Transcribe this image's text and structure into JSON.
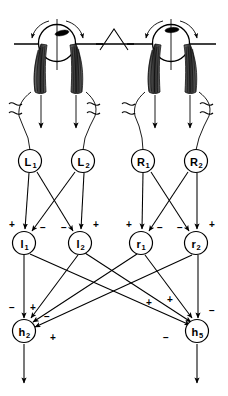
{
  "figure": {
    "title": "",
    "type": "neural-network-schematic",
    "background_color": "#ffffff",
    "ink_color": "#000000"
  },
  "anatomy": {
    "description": "Two eyeballs seen from above with horizontal reference line and central nose triangle",
    "left_eye": {
      "name": "left-eye",
      "pupil": "pupil-marker",
      "rotation_arrows": 2,
      "muscles": 2
    },
    "right_eye": {
      "name": "right-eye",
      "pupil": "pupil-marker",
      "rotation_arrows": 2,
      "muscles": 2
    },
    "nose": {
      "name": "nose-triangle"
    },
    "horizontal_axis": {
      "name": "horizontal-reference-line"
    },
    "break_symbols": 4,
    "efferent_arrows": 4
  },
  "layers": [
    {
      "id": "sensory",
      "name": "sensory-layer",
      "nodes": [
        {
          "id": "L1",
          "base": "L",
          "sub": "1",
          "cx": 30,
          "cy": 161
        },
        {
          "id": "L2",
          "base": "L",
          "sub": "2",
          "cx": 83,
          "cy": 161
        },
        {
          "id": "R1",
          "base": "R",
          "sub": "1",
          "cx": 143,
          "cy": 161
        },
        {
          "id": "R2",
          "base": "R",
          "sub": "2",
          "cx": 196,
          "cy": 161
        }
      ]
    },
    {
      "id": "interneuron",
      "name": "interneuron-layer",
      "nodes": [
        {
          "id": "l1",
          "base": "l",
          "sub": "1",
          "cx": 24,
          "cy": 243
        },
        {
          "id": "l2",
          "base": "l",
          "sub": "2",
          "cx": 80,
          "cy": 243
        },
        {
          "id": "r1",
          "base": "r",
          "sub": "1",
          "cx": 141,
          "cy": 243
        },
        {
          "id": "r2",
          "base": "r",
          "sub": "2",
          "cx": 196,
          "cy": 243
        }
      ]
    },
    {
      "id": "motor",
      "name": "motor-output-layer",
      "nodes": [
        {
          "id": "h2",
          "base": "h",
          "sub": "2",
          "cx": 24,
          "cy": 331
        },
        {
          "id": "h5",
          "base": "h",
          "sub": "5",
          "cx": 197,
          "cy": 331
        }
      ]
    }
  ],
  "signs": {
    "interneuron_layer": [
      {
        "for": "l1",
        "left": "+",
        "right": "−"
      },
      {
        "for": "l2",
        "left": "−",
        "right": "+"
      },
      {
        "for": "r1",
        "left": "+",
        "right": "−"
      },
      {
        "for": "r2",
        "left": "−",
        "right": "+"
      }
    ],
    "motor_layer": [
      {
        "for": "h2",
        "marks": [
          "−",
          "+",
          "−",
          "+"
        ]
      },
      {
        "for": "h5",
        "marks": [
          "+",
          "+",
          "−",
          "−"
        ]
      }
    ]
  },
  "sign_glyphs": {
    "plus": "+",
    "minus": "−"
  },
  "connections": {
    "sensory_to_interneuron": "each sensory node projects straight down and crosses to the paired interneuron",
    "interneuron_to_motor": "all four interneurons converge on both motor nodes",
    "motor_output": "each motor node emits a downward output arrow"
  }
}
